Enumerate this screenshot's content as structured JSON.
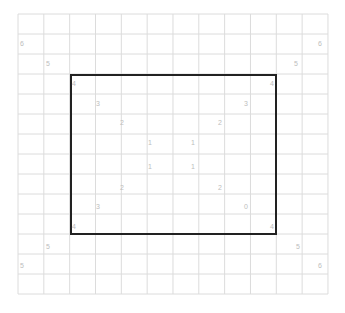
{
  "grid": {
    "left": 18,
    "top": 14,
    "cols": 12,
    "rows": 14,
    "cell_w": 25.83,
    "cell_h": 20,
    "line_color": "#dcdcdc"
  },
  "rectangle": {
    "x": 70,
    "y": 74,
    "w": 207,
    "h": 161,
    "color": "#222222"
  },
  "labels": [
    {
      "text": "6",
      "x": 22,
      "y": 43
    },
    {
      "text": "5",
      "x": 48,
      "y": 63
    },
    {
      "text": "4",
      "x": 74,
      "y": 83
    },
    {
      "text": "3",
      "x": 98,
      "y": 103
    },
    {
      "text": "2",
      "x": 122,
      "y": 122
    },
    {
      "text": "1",
      "x": 150,
      "y": 142
    },
    {
      "text": "6",
      "x": 320,
      "y": 43
    },
    {
      "text": "5",
      "x": 296,
      "y": 63
    },
    {
      "text": "4",
      "x": 272,
      "y": 83
    },
    {
      "text": "3",
      "x": 246,
      "y": 103
    },
    {
      "text": "2",
      "x": 220,
      "y": 122
    },
    {
      "text": "1",
      "x": 193,
      "y": 142
    },
    {
      "text": "1",
      "x": 150,
      "y": 166
    },
    {
      "text": "1",
      "x": 193,
      "y": 166
    },
    {
      "text": "2",
      "x": 122,
      "y": 187
    },
    {
      "text": "2",
      "x": 220,
      "y": 187
    },
    {
      "text": "3",
      "x": 98,
      "y": 206
    },
    {
      "text": "0",
      "x": 246,
      "y": 206
    },
    {
      "text": "4",
      "x": 74,
      "y": 226
    },
    {
      "text": "4",
      "x": 272,
      "y": 226
    },
    {
      "text": "5",
      "x": 48,
      "y": 246
    },
    {
      "text": "5",
      "x": 298,
      "y": 246
    },
    {
      "text": "5",
      "x": 22,
      "y": 265
    },
    {
      "text": "6",
      "x": 320,
      "y": 265
    }
  ]
}
